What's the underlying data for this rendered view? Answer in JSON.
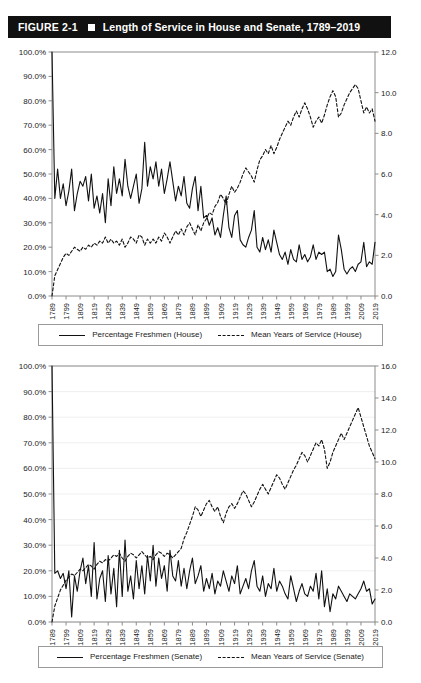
{
  "figure": {
    "label": "FIGURE 2-1",
    "title": "Length of Service in House and Senate, 1789–2019",
    "bar_color": "#111111",
    "bar_text_color": "#ffffff"
  },
  "charts": [
    {
      "id": "house",
      "legend": {
        "solid_label": "Percentage Freshmen (House)",
        "dashed_label": "Mean Years of Service (House)"
      }
    },
    {
      "id": "senate",
      "legend": {
        "solid_label": "Percentage Freshmen (Senate)",
        "dashed_label": "Mean Years of Service (Senate)"
      }
    }
  ],
  "chart_data": [
    {
      "type": "line",
      "id": "house-chart",
      "title": "",
      "xlabel": "",
      "ylabel": "",
      "grid": false,
      "legend_position": "bottom",
      "x": [
        1789,
        1791,
        1793,
        1795,
        1797,
        1799,
        1801,
        1803,
        1805,
        1807,
        1809,
        1811,
        1813,
        1815,
        1817,
        1819,
        1821,
        1823,
        1825,
        1827,
        1829,
        1831,
        1833,
        1835,
        1837,
        1839,
        1841,
        1843,
        1845,
        1847,
        1849,
        1851,
        1853,
        1855,
        1857,
        1859,
        1861,
        1863,
        1865,
        1867,
        1869,
        1871,
        1873,
        1875,
        1877,
        1879,
        1881,
        1883,
        1885,
        1887,
        1889,
        1891,
        1893,
        1895,
        1897,
        1899,
        1901,
        1903,
        1905,
        1907,
        1909,
        1911,
        1913,
        1915,
        1917,
        1919,
        1921,
        1923,
        1925,
        1927,
        1929,
        1931,
        1933,
        1935,
        1937,
        1939,
        1941,
        1943,
        1945,
        1947,
        1949,
        1951,
        1953,
        1955,
        1957,
        1959,
        1961,
        1963,
        1965,
        1967,
        1969,
        1971,
        1973,
        1975,
        1977,
        1979,
        1981,
        1983,
        1985,
        1987,
        1989,
        1991,
        1993,
        1995,
        1997,
        1999,
        2001,
        2003,
        2005,
        2007,
        2009,
        2011,
        2013,
        2015,
        2017,
        2019
      ],
      "x_ticks": [
        1789,
        1799,
        1809,
        1819,
        1829,
        1839,
        1849,
        1859,
        1869,
        1879,
        1889,
        1899,
        1909,
        1919,
        1929,
        1939,
        1949,
        1959,
        1969,
        1979,
        1989,
        1999,
        2009,
        2019
      ],
      "left_axis": {
        "label": "",
        "ylim": [
          0,
          1.0
        ],
        "tick_values": [
          0,
          0.1,
          0.2,
          0.3,
          0.4,
          0.5,
          0.6,
          0.7,
          0.8,
          0.9,
          1.0
        ],
        "tick_labels": [
          "0.0%",
          "10.0%",
          "20.0%",
          "30.0%",
          "40.0%",
          "50.0%",
          "60.0%",
          "70.0%",
          "80.0%",
          "90.0%",
          "100.0%"
        ]
      },
      "right_axis": {
        "label": "",
        "ylim": [
          0,
          12.0
        ],
        "tick_values": [
          0,
          2,
          4,
          6,
          8,
          10,
          12
        ],
        "tick_labels": [
          "0.0",
          "2.0",
          "4.0",
          "6.0",
          "8.0",
          "10.0",
          "12.0"
        ]
      },
      "series": [
        {
          "name": "Percentage Freshmen (House)",
          "axis": "left",
          "style": "solid",
          "color": "#111111",
          "values": [
            1.0,
            0.4,
            0.52,
            0.4,
            0.46,
            0.37,
            0.43,
            0.52,
            0.35,
            0.42,
            0.47,
            0.45,
            0.49,
            0.39,
            0.5,
            0.36,
            0.41,
            0.34,
            0.42,
            0.3,
            0.48,
            0.37,
            0.53,
            0.42,
            0.48,
            0.41,
            0.56,
            0.45,
            0.4,
            0.45,
            0.5,
            0.38,
            0.44,
            0.63,
            0.45,
            0.53,
            0.48,
            0.55,
            0.45,
            0.52,
            0.42,
            0.48,
            0.55,
            0.47,
            0.39,
            0.45,
            0.41,
            0.49,
            0.38,
            0.36,
            0.44,
            0.49,
            0.35,
            0.45,
            0.32,
            0.33,
            0.29,
            0.32,
            0.25,
            0.28,
            0.24,
            0.33,
            0.41,
            0.28,
            0.24,
            0.33,
            0.35,
            0.23,
            0.21,
            0.2,
            0.24,
            0.27,
            0.35,
            0.2,
            0.18,
            0.24,
            0.19,
            0.23,
            0.18,
            0.27,
            0.22,
            0.17,
            0.15,
            0.18,
            0.13,
            0.19,
            0.15,
            0.14,
            0.21,
            0.15,
            0.17,
            0.14,
            0.16,
            0.21,
            0.15,
            0.18,
            0.17,
            0.18,
            0.1,
            0.11,
            0.08,
            0.1,
            0.25,
            0.19,
            0.11,
            0.09,
            0.11,
            0.12,
            0.1,
            0.13,
            0.14,
            0.22,
            0.12,
            0.14,
            0.13,
            0.22
          ]
        },
        {
          "name": "Mean Years of Service (House)",
          "axis": "right",
          "style": "dashed",
          "color": "#111111",
          "values": [
            0.0,
            1.0,
            1.3,
            1.6,
            1.9,
            2.1,
            2.0,
            2.2,
            2.4,
            2.3,
            2.2,
            2.4,
            2.3,
            2.5,
            2.4,
            2.6,
            2.5,
            2.7,
            2.6,
            2.9,
            2.6,
            2.8,
            2.6,
            2.7,
            2.5,
            2.8,
            2.4,
            2.6,
            2.9,
            2.8,
            2.6,
            3.0,
            2.9,
            2.5,
            2.8,
            2.6,
            2.8,
            2.6,
            2.9,
            2.7,
            3.1,
            2.9,
            2.6,
            2.9,
            3.2,
            3.0,
            3.3,
            3.0,
            3.4,
            3.6,
            3.3,
            3.0,
            3.5,
            3.2,
            3.6,
            3.8,
            4.1,
            4.0,
            4.4,
            4.6,
            5.0,
            4.8,
            4.5,
            5.0,
            5.4,
            5.1,
            5.3,
            5.6,
            6.0,
            6.3,
            6.1,
            5.9,
            5.6,
            6.2,
            6.7,
            6.9,
            7.2,
            7.0,
            7.4,
            7.0,
            7.3,
            7.7,
            8.0,
            8.3,
            8.6,
            8.4,
            8.8,
            9.1,
            8.8,
            9.2,
            9.5,
            9.2,
            8.8,
            8.3,
            8.6,
            8.8,
            8.5,
            8.9,
            9.4,
            9.8,
            10.1,
            9.8,
            8.8,
            9.0,
            9.4,
            9.7,
            10.0,
            10.2,
            10.4,
            10.2,
            9.6,
            9.0,
            9.3,
            9.0,
            9.2,
            8.6
          ]
        }
      ]
    },
    {
      "type": "line",
      "id": "senate-chart",
      "title": "",
      "xlabel": "",
      "ylabel": "",
      "grid": true,
      "legend_position": "bottom",
      "x": [
        1789,
        1791,
        1793,
        1795,
        1797,
        1799,
        1801,
        1803,
        1805,
        1807,
        1809,
        1811,
        1813,
        1815,
        1817,
        1819,
        1821,
        1823,
        1825,
        1827,
        1829,
        1831,
        1833,
        1835,
        1837,
        1839,
        1841,
        1843,
        1845,
        1847,
        1849,
        1851,
        1853,
        1855,
        1857,
        1859,
        1861,
        1863,
        1865,
        1867,
        1869,
        1871,
        1873,
        1875,
        1877,
        1879,
        1881,
        1883,
        1885,
        1887,
        1889,
        1891,
        1893,
        1895,
        1897,
        1899,
        1901,
        1903,
        1905,
        1907,
        1909,
        1911,
        1913,
        1915,
        1917,
        1919,
        1921,
        1923,
        1925,
        1927,
        1929,
        1931,
        1933,
        1935,
        1937,
        1939,
        1941,
        1943,
        1945,
        1947,
        1949,
        1951,
        1953,
        1955,
        1957,
        1959,
        1961,
        1963,
        1965,
        1967,
        1969,
        1971,
        1973,
        1975,
        1977,
        1979,
        1981,
        1983,
        1985,
        1987,
        1989,
        1991,
        1993,
        1995,
        1997,
        1999,
        2001,
        2003,
        2005,
        2007,
        2009,
        2011,
        2013,
        2015,
        2017,
        2019
      ],
      "x_ticks": [
        1789,
        1799,
        1809,
        1819,
        1829,
        1839,
        1849,
        1859,
        1869,
        1879,
        1889,
        1899,
        1909,
        1919,
        1929,
        1939,
        1949,
        1959,
        1969,
        1979,
        1989,
        1999,
        2009,
        2019
      ],
      "left_axis": {
        "label": "",
        "ylim": [
          0,
          1.0
        ],
        "tick_values": [
          0,
          0.1,
          0.2,
          0.3,
          0.4,
          0.5,
          0.6,
          0.7,
          0.8,
          0.9,
          1.0
        ],
        "tick_labels": [
          "0.0%",
          "10.0%",
          "20.0%",
          "30.0%",
          "40.0%",
          "50.0%",
          "60.0%",
          "70.0%",
          "80.0%",
          "90.0%",
          "100.0%"
        ]
      },
      "right_axis": {
        "label": "",
        "ylim": [
          0,
          16.0
        ],
        "tick_values": [
          0,
          2,
          4,
          6,
          8,
          10,
          12,
          14,
          16
        ],
        "tick_labels": [
          "0.0",
          "2.0",
          "4.0",
          "6.0",
          "8.0",
          "10.0",
          "12.0",
          "14.0",
          "16.0"
        ]
      },
      "series": [
        {
          "name": "Percentage Freshmen (Senate)",
          "axis": "left",
          "style": "solid",
          "color": "#111111",
          "values": [
            1.0,
            0.19,
            0.2,
            0.17,
            0.19,
            0.13,
            0.2,
            0.02,
            0.18,
            0.12,
            0.2,
            0.25,
            0.15,
            0.22,
            0.1,
            0.31,
            0.09,
            0.17,
            0.2,
            0.08,
            0.26,
            0.11,
            0.21,
            0.06,
            0.28,
            0.1,
            0.32,
            0.12,
            0.18,
            0.09,
            0.24,
            0.13,
            0.22,
            0.11,
            0.26,
            0.16,
            0.3,
            0.14,
            0.25,
            0.17,
            0.22,
            0.12,
            0.28,
            0.18,
            0.16,
            0.24,
            0.14,
            0.21,
            0.13,
            0.2,
            0.25,
            0.15,
            0.18,
            0.22,
            0.12,
            0.17,
            0.13,
            0.19,
            0.11,
            0.16,
            0.14,
            0.2,
            0.16,
            0.12,
            0.18,
            0.15,
            0.22,
            0.11,
            0.14,
            0.17,
            0.13,
            0.2,
            0.24,
            0.14,
            0.12,
            0.18,
            0.1,
            0.15,
            0.13,
            0.21,
            0.12,
            0.16,
            0.14,
            0.11,
            0.09,
            0.18,
            0.13,
            0.08,
            0.12,
            0.15,
            0.11,
            0.1,
            0.14,
            0.12,
            0.19,
            0.09,
            0.2,
            0.06,
            0.13,
            0.04,
            0.11,
            0.09,
            0.14,
            0.12,
            0.1,
            0.08,
            0.11,
            0.1,
            0.09,
            0.11,
            0.13,
            0.16,
            0.12,
            0.13,
            0.07,
            0.09
          ]
        },
        {
          "name": "Mean Years of Service (Senate)",
          "axis": "right",
          "style": "dashed",
          "color": "#111111",
          "values": [
            0.0,
            1.0,
            1.5,
            2.0,
            2.3,
            2.6,
            2.8,
            3.0,
            2.9,
            3.1,
            3.3,
            3.2,
            3.4,
            3.6,
            3.5,
            3.3,
            3.6,
            3.8,
            3.7,
            3.9,
            3.8,
            4.0,
            4.2,
            4.1,
            4.3,
            4.0,
            3.8,
            4.1,
            4.3,
            4.2,
            4.0,
            4.2,
            4.4,
            4.2,
            4.0,
            4.1,
            3.9,
            4.2,
            4.4,
            4.3,
            4.1,
            4.3,
            4.2,
            4.0,
            4.2,
            4.4,
            4.6,
            5.2,
            5.6,
            6.1,
            6.6,
            7.2,
            7.0,
            6.6,
            7.0,
            7.4,
            7.6,
            7.2,
            6.9,
            7.2,
            6.6,
            6.2,
            6.8,
            7.2,
            7.4,
            7.1,
            7.4,
            7.8,
            8.2,
            8.0,
            7.6,
            7.2,
            7.5,
            7.9,
            8.3,
            8.6,
            8.3,
            8.0,
            8.4,
            8.8,
            9.2,
            9.0,
            8.6,
            8.3,
            8.7,
            9.1,
            9.5,
            9.8,
            10.2,
            10.6,
            10.4,
            10.0,
            10.4,
            10.8,
            11.2,
            11.0,
            11.4,
            10.8,
            9.6,
            10.0,
            10.6,
            11.0,
            11.4,
            11.8,
            11.4,
            11.8,
            12.2,
            12.6,
            13.0,
            13.4,
            12.8,
            12.2,
            11.6,
            11.0,
            10.6,
            10.2
          ]
        }
      ]
    }
  ]
}
